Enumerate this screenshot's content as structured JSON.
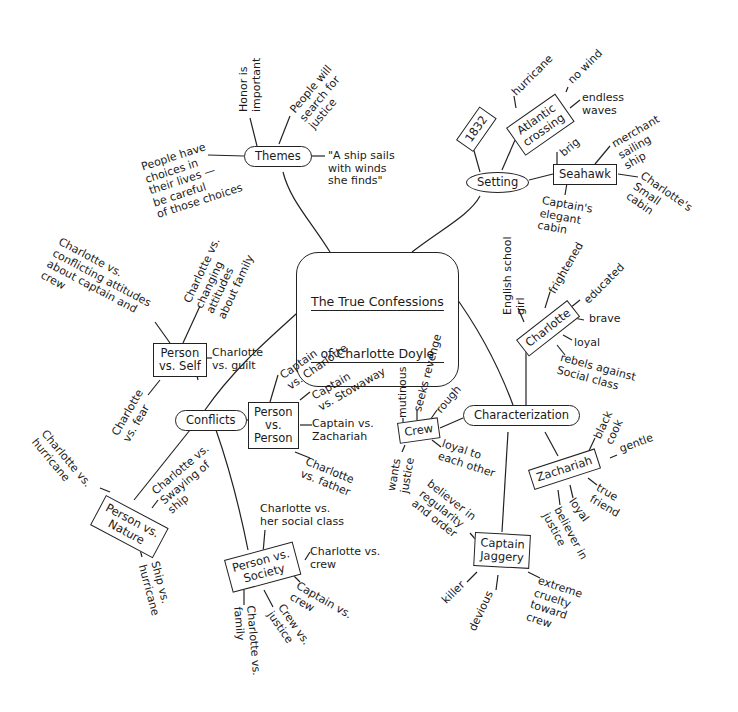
{
  "title": {
    "line1": "The True Confessions",
    "line2": "of Charlotte Doyle"
  },
  "themes": {
    "label": "Themes",
    "items": [
      "Honor is\nimportant",
      "People will\nsearch for\njustice",
      "People have\nchoices in\ntheir lives —\nbe careful\nof those choices",
      "\"A ship sails\nwith winds\nshe finds\""
    ]
  },
  "setting": {
    "label": "Setting",
    "year": "1832",
    "atlantic": {
      "label": "Atlantic\ncrossing",
      "items": [
        "hurricane",
        "no wind",
        "endless\nwaves"
      ]
    },
    "seahawk": {
      "label": "Seahawk",
      "items": [
        "brig",
        "merchant\nsailing\nship",
        "Charlotte's\nSmall\ncabin",
        "Captain's\nelegant\ncabin"
      ]
    }
  },
  "conflicts": {
    "label": "Conflicts",
    "person_vs_self": {
      "label": "Person\nvs. Self",
      "items": [
        "Charlotte vs.\nconflicting attitudes\nabout captain and\ncrew",
        "Charlotte vs.\nchanging\nattitudes\nabout family",
        "Charlotte\nvs. guilt",
        "Charlotte\nvs. fear"
      ]
    },
    "person_vs_person": {
      "label": "Person\nvs.\nPerson",
      "items": [
        "Captain\nvs. Charlotte",
        "Captain\nvs. Stowaway",
        "Captain vs.\nZachariah",
        "Charlotte\nvs. father"
      ]
    },
    "person_vs_nature": {
      "label": "Person vs.\nNature",
      "items": [
        "Charlotte vs.\nhurricane",
        "Charlotte vs.\nSwaying of\nship",
        "Ship vs.\nhurricane"
      ]
    },
    "person_vs_society": {
      "label": "Person vs.\nSociety",
      "items": [
        "Charlotte vs.\nher social class",
        "Charlotte vs.\ncrew",
        "Captain vs.\ncrew",
        "Crew vs.\njustice",
        "Charlotte vs.\nfamily"
      ]
    }
  },
  "characterization": {
    "label": "Characterization",
    "charlotte": {
      "label": "Charlotte",
      "items": [
        "English school\ngirl",
        "frightened",
        "educated",
        "brave",
        "loyal",
        "rebels against\nSocial class"
      ]
    },
    "crew": {
      "label": "Crew",
      "items": [
        "mutinous",
        "seeks revenge",
        "rough",
        "wants\njustice",
        "loyal to\neach other"
      ]
    },
    "zachariah": {
      "label": "Zachariah",
      "items": [
        "black\ncook",
        "gentle",
        "true\nfriend",
        "loyal",
        "believer in\njustice"
      ]
    },
    "captain_jaggery": {
      "label": "Captain\nJaggery",
      "items": [
        "believer in\nregularity\nand order",
        "killer",
        "devious",
        "extreme\ncruelty\ntoward\ncrew"
      ]
    }
  }
}
